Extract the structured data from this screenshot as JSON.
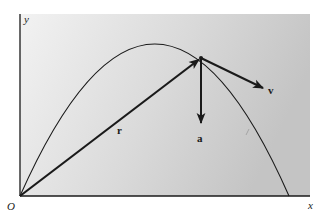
{
  "diagram": {
    "colors": {
      "background": "#ffffff",
      "panel_light": "#f1f1f1",
      "panel_dark": "#c9c9c9",
      "ink": "#1a1a1a"
    },
    "axes": {
      "origin_label": "O",
      "x_label": "x",
      "y_label": "y"
    },
    "vectors": {
      "position_label": "r",
      "velocity_label": "v",
      "acceleration_label": "a"
    },
    "geometry": {
      "origin": [
        20,
        196
      ],
      "x_axis_end": [
        310,
        196
      ],
      "y_axis_top": [
        20,
        14
      ],
      "parabola": {
        "start": [
          20,
          196
        ],
        "control": [
          155,
          -108
        ],
        "end": [
          289,
          196
        ]
      },
      "point": [
        201,
        58
      ],
      "r_end": [
        201,
        58
      ],
      "a_end": [
        201,
        123
      ],
      "v_end": [
        263,
        88
      ]
    }
  }
}
